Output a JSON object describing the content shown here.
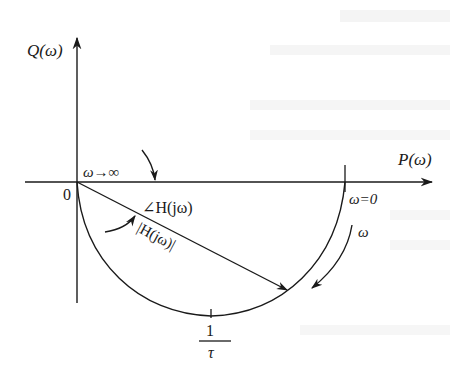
{
  "diagram": {
    "axes": {
      "y_label": "Q(ω)",
      "x_label": "P(ω)",
      "origin_label": "0"
    },
    "annotations": {
      "omega_infinity": "ω→∞",
      "omega_zero": "ω=0",
      "omega_direction": "ω",
      "phase_label": "∠H(jω)",
      "magnitude_label": "|H(jω)|",
      "corner_num": "1",
      "corner_den": "τ"
    },
    "colors": {
      "stroke": "#1a1a1a",
      "background": "#ffffff"
    }
  }
}
